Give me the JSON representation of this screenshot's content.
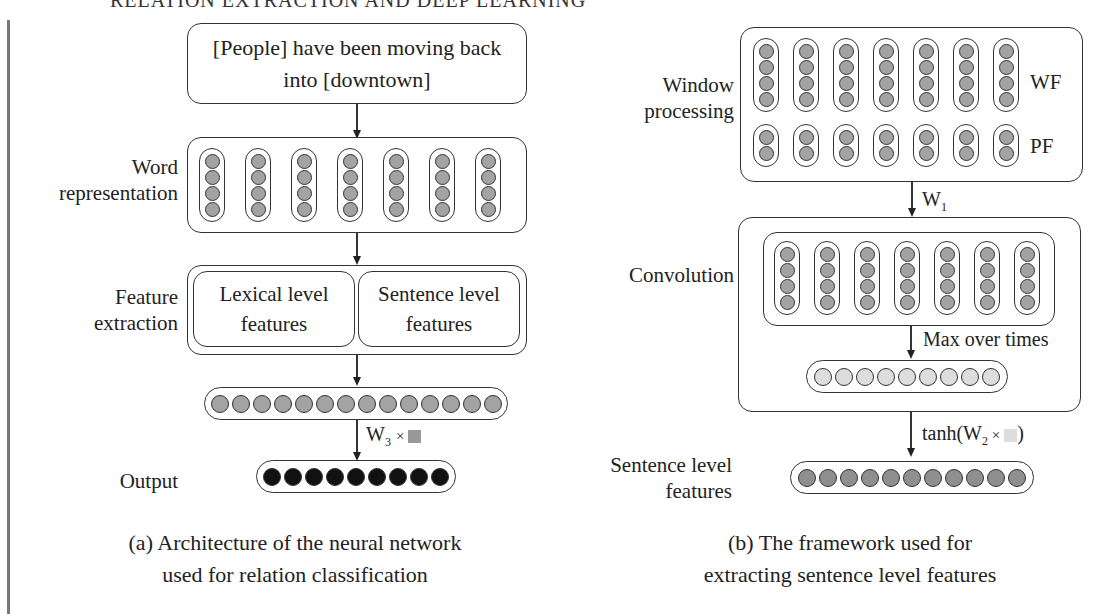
{
  "page": {
    "running_header": "RELATION EXTRACTION AND DEEP LEARNING"
  },
  "figure_a": {
    "input_sentence_line1": "[People] have been moving back",
    "input_sentence_line2": "into [downtown]",
    "labels": {
      "word_rep_1": "Word",
      "word_rep_2": "representation",
      "feature_1": "Feature",
      "feature_2": "extraction",
      "output": "Output"
    },
    "word_columns": 7,
    "word_dims": 4,
    "lexical_1": "Lexical level",
    "lexical_2": "features",
    "sentence_1": "Sentence level",
    "sentence_2": "features",
    "feature_vector_size": 14,
    "output_vector_size": 9,
    "w3_label": "W",
    "w3_sub": "3",
    "w3_op": "×",
    "w3_square_color": "#999999",
    "caption_line1": "(a) Architecture of the neural network",
    "caption_line2": "used for relation classification"
  },
  "figure_b": {
    "labels": {
      "window_1": "Window",
      "window_2": "processing",
      "convolution": "Convolution",
      "sent_1": "Sentence level",
      "sent_2": "features"
    },
    "wf_label": "WF",
    "pf_label": "PF",
    "wf_columns": 7,
    "wf_dims": 4,
    "pf_dims": 2,
    "w1_label": "W",
    "w1_sub": "1",
    "conv_columns": 7,
    "conv_dims": 4,
    "max_label": "Max over times",
    "max_vector_size": 9,
    "tanh_prefix": "tanh(W",
    "tanh_sub": "2",
    "tanh_op": " ×",
    "tanh_suffix": ")",
    "tanh_square_color": "#dddddd",
    "sentence_vector_size": 11,
    "caption_line1": "(b) The framework used for",
    "caption_line2": "extracting sentence level features"
  },
  "colors": {
    "dot_gray": "#a3a3a3",
    "dot_light": "#dddddd",
    "dot_dark": "#111111",
    "dot_sentence": "#8f8f8f"
  }
}
